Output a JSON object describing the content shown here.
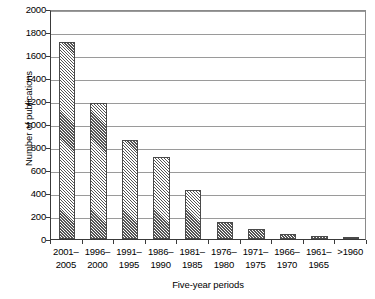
{
  "chart_data": {
    "type": "bar",
    "title": "",
    "xlabel": "Five-year periods",
    "ylabel": "Number of publications",
    "categories": [
      "2001–2005",
      "1996–2000",
      "1991–1995",
      "1986–1990",
      "1981–1985",
      "1976–1980",
      "1971–1975",
      "1966–1970",
      "1961–1965",
      ">1960"
    ],
    "category_lines": [
      [
        "2001–",
        "2005"
      ],
      [
        "1996–",
        "2000"
      ],
      [
        "1991–",
        "1995"
      ],
      [
        "1986–",
        "1990"
      ],
      [
        "1981–",
        "1985"
      ],
      [
        "1976–",
        "1980"
      ],
      [
        "1971–",
        "1975"
      ],
      [
        "1966–",
        "1970"
      ],
      [
        "1961–",
        "1965"
      ],
      [
        ">1960",
        ""
      ]
    ],
    "values": [
      1715,
      1180,
      860,
      710,
      425,
      150,
      85,
      40,
      30,
      18
    ],
    "ylim": [
      0,
      2000
    ],
    "ytick_step": 200,
    "yticks": [
      0,
      200,
      400,
      600,
      800,
      1000,
      1200,
      1400,
      1600,
      1800,
      2000
    ],
    "grid": true,
    "legend": false,
    "legend_position": "none",
    "bar_fill": "diagonal-hatch",
    "bar_edge_color": "#4a4a4a",
    "gridline_color": "#9a9a9a",
    "axis_color": "#3a3a3a"
  }
}
